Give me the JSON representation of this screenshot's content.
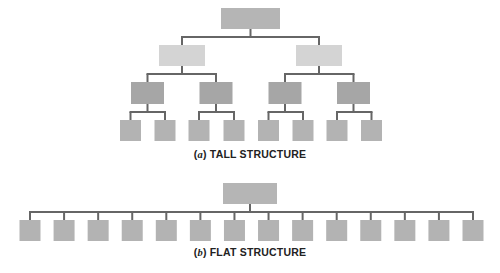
{
  "colors": {
    "top": "#b5b5b5",
    "level2": "#d4d4d4",
    "level3": "#a6a6a6",
    "leaf": "#b3b3b3",
    "line": "#666666"
  },
  "tall": {
    "caption_letter": "a",
    "caption_text": "TALL STRUCTURE",
    "levels": [
      1,
      2,
      4,
      8
    ]
  },
  "flat": {
    "caption_letter": "b",
    "caption_text": "FLAT STRUCTURE",
    "levels": [
      1,
      14
    ]
  }
}
